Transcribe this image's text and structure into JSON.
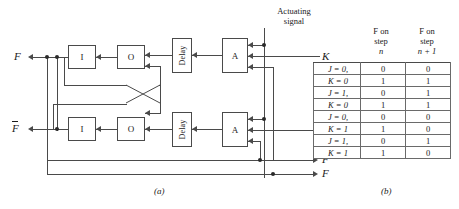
{
  "figure": {
    "caption_a": "(a)",
    "caption_b": "(b)"
  },
  "diagram": {
    "blocks": {
      "inverter_top": "I",
      "or_top": "O",
      "delay_top": "Delay",
      "and_top": "A",
      "inverter_bottom": "I",
      "or_bottom": "O",
      "delay_bottom": "Delay",
      "and_bottom": "A"
    },
    "labels": {
      "output_f_top": "F",
      "output_fbar_left": "F",
      "output_fbar_right": "F",
      "output_f_right": "F",
      "input_k": "K",
      "input_j": "J",
      "actuating_line1": "Actuating",
      "actuating_line2": "signal"
    }
  },
  "table": {
    "header_col2": {
      "line1": "F on",
      "line2": "step",
      "line3": "n"
    },
    "header_col3": {
      "line1": "F on",
      "line2": "step",
      "line3": "n + 1"
    },
    "rows": [
      {
        "cond_line1": "J = 0,",
        "cond_line2": "K = 0",
        "pairs": [
          [
            "0",
            "0"
          ],
          [
            "1",
            "1"
          ]
        ]
      },
      {
        "cond_line1": "J = 1,",
        "cond_line2": "K = 0",
        "pairs": [
          [
            "0",
            "1"
          ],
          [
            "1",
            "1"
          ]
        ]
      },
      {
        "cond_line1": "J = 0,",
        "cond_line2": "K = 1",
        "pairs": [
          [
            "0",
            "0"
          ],
          [
            "1",
            "0"
          ]
        ]
      },
      {
        "cond_line1": "J = 1,",
        "cond_line2": "K = 1",
        "pairs": [
          [
            "0",
            "1"
          ],
          [
            "1",
            "0"
          ]
        ]
      }
    ]
  }
}
